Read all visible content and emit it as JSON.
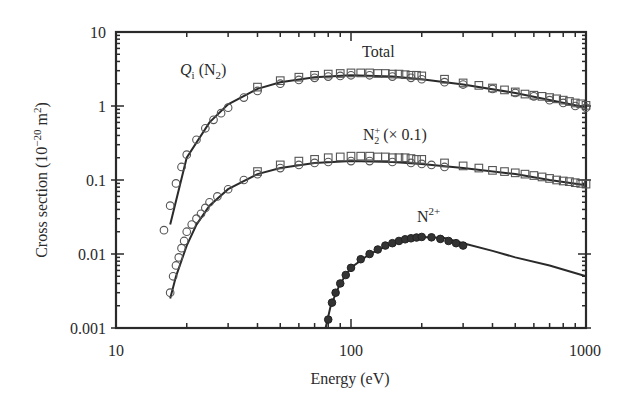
{
  "chart_data": {
    "type": "scatter",
    "title": "",
    "xlabel": "Energy (eV)",
    "ylabel": "Cross section (10⁻²⁰ m²)",
    "xscale": "log",
    "yscale": "log",
    "xlim": [
      10,
      1000
    ],
    "ylim": [
      0.001,
      10
    ],
    "x_ticks": [
      "10",
      "100",
      "1000"
    ],
    "y_ticks": [
      "0.001",
      "0.01",
      "0.1",
      "1",
      "10"
    ],
    "grid": false,
    "legend": "none (inline curve annotations)",
    "annotations": [
      {
        "text": "Qᵢ (N₂)",
        "near": "Total curve, low energy"
      },
      {
        "text": "Total",
        "near": "top curve peak"
      },
      {
        "text": "N₂⁺ (× 0.1)",
        "near": "middle curve"
      },
      {
        "text": "N²⁺",
        "near": "bottom curve peak"
      }
    ],
    "series": [
      {
        "name": "Total (fit line)",
        "style": "line",
        "x": [
          17,
          20,
          25,
          30,
          40,
          50,
          70,
          100,
          150,
          200,
          300,
          500,
          700,
          1000
        ],
        "y": [
          0.025,
          0.2,
          0.6,
          1.05,
          1.7,
          2.1,
          2.45,
          2.6,
          2.5,
          2.3,
          1.95,
          1.5,
          1.2,
          0.95
        ]
      },
      {
        "name": "Total (circles)",
        "style": "open-circle",
        "x": [
          16,
          17,
          18,
          19,
          20,
          22,
          24,
          26,
          28,
          30,
          35,
          40,
          50,
          60,
          70,
          80,
          90,
          100,
          120,
          150,
          180,
          200,
          250,
          300,
          400,
          500,
          600,
          700,
          800,
          900,
          1000
        ],
        "y": [
          0.021,
          0.045,
          0.09,
          0.15,
          0.22,
          0.35,
          0.5,
          0.65,
          0.8,
          0.95,
          1.3,
          1.6,
          2.0,
          2.25,
          2.4,
          2.5,
          2.55,
          2.6,
          2.6,
          2.5,
          2.4,
          2.3,
          2.1,
          1.95,
          1.7,
          1.5,
          1.35,
          1.2,
          1.1,
          1.0,
          0.95
        ]
      },
      {
        "name": "Total (squares)",
        "style": "open-square",
        "x": [
          40,
          50,
          60,
          70,
          80,
          90,
          100,
          110,
          120,
          130,
          140,
          150,
          160,
          170,
          180,
          190,
          200,
          250,
          300,
          350,
          400,
          450,
          500,
          550,
          600,
          650,
          700,
          750,
          800,
          850,
          900,
          950,
          1000
        ],
        "y": [
          1.8,
          2.2,
          2.45,
          2.6,
          2.7,
          2.75,
          2.8,
          2.8,
          2.8,
          2.75,
          2.75,
          2.7,
          2.7,
          2.65,
          2.6,
          2.6,
          2.55,
          2.3,
          2.05,
          1.9,
          1.75,
          1.65,
          1.55,
          1.45,
          1.4,
          1.35,
          1.3,
          1.25,
          1.2,
          1.15,
          1.1,
          1.07,
          1.02
        ]
      },
      {
        "name": "N2+ x0.1 (fit line)",
        "style": "line",
        "x": [
          17,
          18,
          20,
          22,
          25,
          30,
          40,
          50,
          70,
          100,
          150,
          200,
          300,
          500,
          700,
          1000
        ],
        "y": [
          0.0025,
          0.005,
          0.013,
          0.025,
          0.045,
          0.075,
          0.12,
          0.145,
          0.17,
          0.18,
          0.175,
          0.165,
          0.145,
          0.12,
          0.1,
          0.085
        ]
      },
      {
        "name": "N2+ x0.1 (circles/diamonds)",
        "style": "open-circle",
        "x": [
          17,
          17.5,
          18,
          18.5,
          19,
          19.5,
          20,
          21,
          22,
          23,
          24,
          25,
          27,
          30,
          35,
          40,
          50,
          60,
          70,
          80,
          100,
          120,
          150,
          180,
          200,
          220,
          250
        ],
        "y": [
          0.003,
          0.005,
          0.007,
          0.009,
          0.012,
          0.015,
          0.02,
          0.025,
          0.03,
          0.035,
          0.042,
          0.05,
          0.06,
          0.075,
          0.1,
          0.12,
          0.145,
          0.16,
          0.17,
          0.175,
          0.18,
          0.18,
          0.175,
          0.17,
          0.165,
          0.16,
          0.15
        ]
      },
      {
        "name": "N2+ x0.1 (squares)",
        "style": "open-square",
        "x": [
          40,
          50,
          60,
          70,
          80,
          90,
          100,
          110,
          120,
          130,
          140,
          150,
          160,
          170,
          180,
          190,
          200,
          250,
          300,
          350,
          400,
          450,
          500,
          550,
          600,
          650,
          700,
          750,
          800,
          850,
          900,
          950,
          1000
        ],
        "y": [
          0.13,
          0.16,
          0.18,
          0.19,
          0.2,
          0.205,
          0.21,
          0.21,
          0.21,
          0.205,
          0.205,
          0.2,
          0.2,
          0.2,
          0.195,
          0.19,
          0.19,
          0.17,
          0.155,
          0.145,
          0.135,
          0.13,
          0.125,
          0.12,
          0.115,
          0.11,
          0.105,
          0.1,
          0.097,
          0.095,
          0.092,
          0.09,
          0.088
        ]
      },
      {
        "name": "N2+ doubly-charged (fit line)",
        "style": "line",
        "x": [
          78,
          82,
          90,
          100,
          120,
          150,
          200,
          250,
          300,
          400,
          500,
          700,
          1000
        ],
        "y": [
          0.001,
          0.002,
          0.004,
          0.0065,
          0.01,
          0.014,
          0.017,
          0.0165,
          0.014,
          0.011,
          0.009,
          0.007,
          0.005
        ]
      },
      {
        "name": "N2+ doubly-charged (filled circles)",
        "style": "filled-circle",
        "x": [
          80,
          83,
          86,
          90,
          95,
          100,
          110,
          120,
          130,
          140,
          150,
          160,
          170,
          180,
          190,
          200,
          220,
          240,
          260,
          280,
          300
        ],
        "y": [
          0.0013,
          0.0022,
          0.003,
          0.004,
          0.0052,
          0.0065,
          0.0085,
          0.01,
          0.0115,
          0.013,
          0.014,
          0.015,
          0.0158,
          0.0163,
          0.0167,
          0.017,
          0.0168,
          0.016,
          0.015,
          0.014,
          0.013
        ]
      }
    ]
  },
  "axes": {
    "xlabel": "Energy (eV)",
    "ylabel_main": "Cross section (10",
    "ylabel_exp": "−20",
    "ylabel_unit": " m",
    "ylabel_unit_exp": "2",
    "ylabel_close": ")",
    "x_ticks": [
      "10",
      "100",
      "1000"
    ],
    "y_ticks": [
      "10",
      "1",
      "0.1",
      "0.01",
      "0.001"
    ]
  },
  "annotations": {
    "qi_main": "Q",
    "qi_sub": "i",
    "qi_rest": " (N",
    "qi_sub2": "2",
    "qi_close": ")",
    "total": "Total",
    "n2p_main": "N",
    "n2p_sup": "+",
    "n2p_sub": "2",
    "n2p_rest": " (× 0.1)",
    "n2pp_main": "N",
    "n2pp_sup": "2+"
  },
  "colors": {
    "ink": "#2a2a2a",
    "marker": "#555555",
    "background": "#ffffff"
  }
}
